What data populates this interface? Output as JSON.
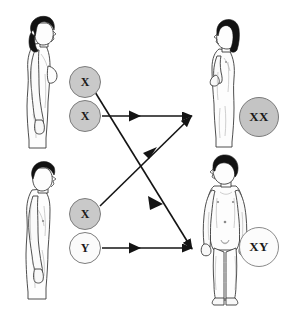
{
  "diagram": {
    "background_color": "#ffffff",
    "line_color": "#1a1a1a"
  },
  "parents": [
    {
      "id": "mother",
      "label": "adult female",
      "view": "profile-right",
      "hair_color": "#111111",
      "skin_color": "#fdfdfd"
    },
    {
      "id": "father",
      "label": "adult male",
      "view": "profile-right",
      "hair_color": "#111111",
      "skin_color": "#fdfdfd"
    }
  ],
  "gametes": [
    {
      "id": "egg-x-1",
      "label": "X",
      "fill": "#c9c9c9",
      "stroke": "#7d7d7d"
    },
    {
      "id": "egg-x-2",
      "label": "X",
      "fill": "#c9c9c9",
      "stroke": "#7d7d7d"
    },
    {
      "id": "sperm-x",
      "label": "X",
      "fill": "#c9c9c9",
      "stroke": "#7d7d7d"
    },
    {
      "id": "sperm-y",
      "label": "Y",
      "fill": "#fbfbfb",
      "stroke": "#8a8a8a"
    }
  ],
  "offspring": [
    {
      "id": "daughter",
      "label": "girl child",
      "view": "profile-left",
      "karyotype": "XX",
      "karyotype_fill": "#c4c4c4"
    },
    {
      "id": "son",
      "label": "boy child",
      "view": "front",
      "karyotype": "XY",
      "karyotype_fill": "#fcfcfc"
    }
  ],
  "arrows": [
    {
      "id": "arrow-egg-x2-to-daughter",
      "from": "egg-x-2",
      "to": "daughter",
      "type": "horizontal"
    },
    {
      "id": "arrow-sperm-x-to-daughter",
      "from": "sperm-x",
      "to": "daughter",
      "type": "diagonal-up"
    },
    {
      "id": "arrow-egg-x1-to-son",
      "from": "egg-x-1",
      "to": "son",
      "type": "diagonal-down"
    },
    {
      "id": "arrow-sperm-y-to-son",
      "from": "sperm-y",
      "to": "son",
      "type": "horizontal"
    }
  ]
}
